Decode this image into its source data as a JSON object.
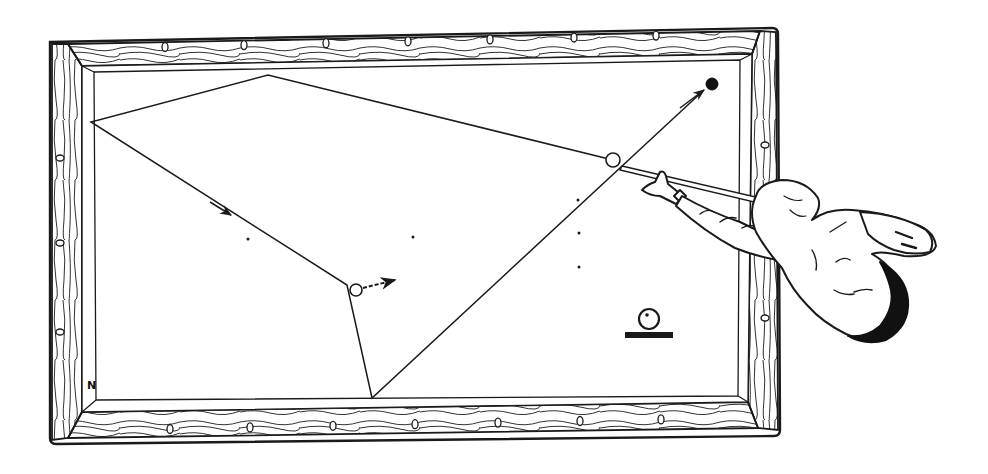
{
  "diagram": {
    "corner_label": "N",
    "colors": {
      "ink": "#1a1a1a",
      "paper": "#ffffff"
    },
    "table": {
      "outer_rail": {
        "x1": 48,
        "y1": 40,
        "x2": 778,
        "y2": 440
      },
      "cushion_inner": {
        "x1": 82,
        "y1": 66,
        "x2": 745,
        "y2": 412
      },
      "diamonds_top_x": [
        165,
        244,
        326,
        408,
        490,
        574,
        656
      ],
      "diamonds_bottom_x": [
        170,
        250,
        333,
        415,
        498,
        580,
        661
      ],
      "diamonds_left_y": [
        158,
        243,
        332
      ],
      "diamonds_right_y": [
        145,
        232,
        318
      ]
    },
    "spots": [
      {
        "x": 248,
        "y": 239
      },
      {
        "x": 413,
        "y": 237
      },
      {
        "x": 578,
        "y": 200
      },
      {
        "x": 579,
        "y": 233
      },
      {
        "x": 579,
        "y": 267
      }
    ],
    "balls": {
      "cue_ball": {
        "x": 613,
        "y": 160,
        "r": 7,
        "filled": false
      },
      "object_ball_white": {
        "x": 356,
        "y": 290,
        "r": 6,
        "filled": false
      },
      "target_ball_black": {
        "x": 712,
        "y": 84,
        "r": 6,
        "filled": true
      }
    },
    "paths": {
      "cue_ball_path": [
        [
          613,
          160
        ],
        [
          268,
          75
        ],
        [
          91,
          122
        ],
        [
          347,
          285
        ],
        [
          372,
          398
        ],
        [
          704,
          90
        ]
      ],
      "object_ball_direction": [
        [
          363,
          288
        ],
        [
          395,
          280
        ]
      ]
    },
    "legend_icon": {
      "name": "ball-on-rail-symbol",
      "ball": {
        "x": 649,
        "y": 319,
        "r": 10
      },
      "bar": {
        "x": 625,
        "y": 332,
        "w": 48,
        "h": 6
      }
    }
  }
}
